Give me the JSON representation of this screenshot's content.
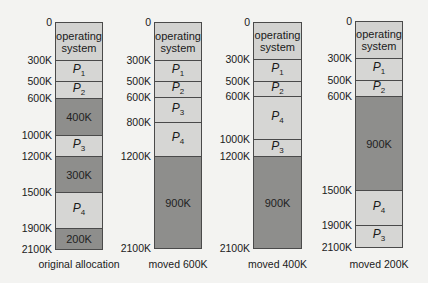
{
  "diagram": {
    "columns": [
      {
        "caption": "original allocation",
        "x": 55,
        "width": 48,
        "addresses": [
          {
            "label": "0",
            "y": 22
          },
          {
            "label": "300K",
            "y": 60
          },
          {
            "label": "500K",
            "y": 81
          },
          {
            "label": "600K",
            "y": 98
          },
          {
            "label": "1000K",
            "y": 135
          },
          {
            "label": "1200K",
            "y": 156
          },
          {
            "label": "1500K",
            "y": 192
          },
          {
            "label": "1900K",
            "y": 228
          },
          {
            "label": "2100K",
            "y": 249
          }
        ],
        "blocks": [
          {
            "type": "os",
            "label": "operating system",
            "top": 22,
            "bottom": 60
          },
          {
            "type": "proc",
            "name": "P",
            "sub": "1",
            "top": 60,
            "bottom": 81
          },
          {
            "type": "proc",
            "name": "P",
            "sub": "2",
            "top": 81,
            "bottom": 98
          },
          {
            "type": "hole",
            "label": "400K",
            "top": 98,
            "bottom": 135
          },
          {
            "type": "proc",
            "name": "P",
            "sub": "3",
            "top": 135,
            "bottom": 156
          },
          {
            "type": "hole",
            "label": "300K",
            "top": 156,
            "bottom": 192
          },
          {
            "type": "proc",
            "name": "P",
            "sub": "4",
            "top": 192,
            "bottom": 228
          },
          {
            "type": "hole",
            "label": "200K",
            "top": 228,
            "bottom": 249
          }
        ]
      },
      {
        "caption": "moved 600K",
        "x": 154,
        "width": 48,
        "addresses": [
          {
            "label": "0",
            "y": 22
          },
          {
            "label": "300K",
            "y": 60
          },
          {
            "label": "500K",
            "y": 81
          },
          {
            "label": "600K",
            "y": 97
          },
          {
            "label": "800K",
            "y": 122
          },
          {
            "label": "1200K",
            "y": 156
          },
          {
            "label": "2100K",
            "y": 248
          }
        ],
        "blocks": [
          {
            "type": "os",
            "label": "operating system",
            "top": 22,
            "bottom": 60
          },
          {
            "type": "proc",
            "name": "P",
            "sub": "1",
            "top": 60,
            "bottom": 81
          },
          {
            "type": "proc",
            "name": "P",
            "sub": "2",
            "top": 81,
            "bottom": 97
          },
          {
            "type": "proc",
            "name": "P",
            "sub": "3",
            "top": 97,
            "bottom": 122
          },
          {
            "type": "proc",
            "name": "P",
            "sub": "4",
            "top": 122,
            "bottom": 156
          },
          {
            "type": "hole",
            "label": "900K",
            "top": 156,
            "bottom": 248
          }
        ]
      },
      {
        "caption": "moved 400K",
        "x": 253,
        "width": 49,
        "addresses": [
          {
            "label": "0",
            "y": 22
          },
          {
            "label": "300K",
            "y": 59
          },
          {
            "label": "500K",
            "y": 81
          },
          {
            "label": "600K",
            "y": 96
          },
          {
            "label": "1000K",
            "y": 139
          },
          {
            "label": "1200K",
            "y": 156
          },
          {
            "label": "2100K",
            "y": 248
          }
        ],
        "blocks": [
          {
            "type": "os",
            "label": "operating system",
            "top": 22,
            "bottom": 59
          },
          {
            "type": "proc",
            "name": "P",
            "sub": "1",
            "top": 59,
            "bottom": 81
          },
          {
            "type": "proc",
            "name": "P",
            "sub": "2",
            "top": 81,
            "bottom": 96
          },
          {
            "type": "proc",
            "name": "P",
            "sub": "4",
            "top": 96,
            "bottom": 139
          },
          {
            "type": "proc",
            "name": "P",
            "sub": "3",
            "top": 139,
            "bottom": 156
          },
          {
            "type": "hole",
            "label": "900K",
            "top": 156,
            "bottom": 248
          }
        ]
      },
      {
        "caption": "moved 200K",
        "x": 355,
        "width": 48,
        "addresses": [
          {
            "label": "0",
            "y": 21
          },
          {
            "label": "300K",
            "y": 58
          },
          {
            "label": "500K",
            "y": 80
          },
          {
            "label": "600K",
            "y": 96
          },
          {
            "label": "1500K",
            "y": 190
          },
          {
            "label": "1900K",
            "y": 225
          },
          {
            "label": "2100K",
            "y": 247
          }
        ],
        "blocks": [
          {
            "type": "os",
            "label": "operating system",
            "top": 21,
            "bottom": 58
          },
          {
            "type": "proc",
            "name": "P",
            "sub": "1",
            "top": 58,
            "bottom": 80
          },
          {
            "type": "proc",
            "name": "P",
            "sub": "2",
            "top": 80,
            "bottom": 96
          },
          {
            "type": "hole",
            "label": "900K",
            "top": 96,
            "bottom": 190
          },
          {
            "type": "proc",
            "name": "P",
            "sub": "4",
            "top": 190,
            "bottom": 225
          },
          {
            "type": "proc",
            "name": "P",
            "sub": "3",
            "top": 225,
            "bottom": 247
          }
        ]
      }
    ],
    "caption_y": 258
  }
}
